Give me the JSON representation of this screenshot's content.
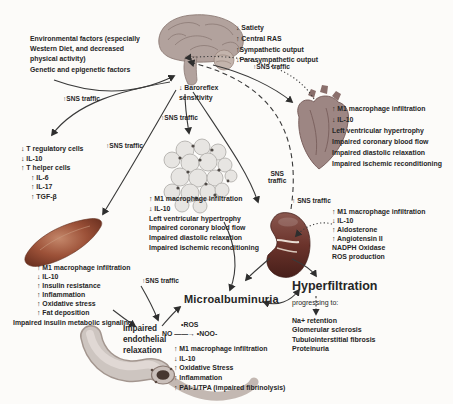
{
  "env_factors": {
    "lines": [
      "Environmental factors (especially",
      "Western Diet, and decreased",
      "physical activity)",
      "Genetic and epigenetic factors"
    ]
  },
  "brain_outputs": {
    "lines": [
      "↓ Satiety",
      "↑ Central RAS",
      "↑Sympathetic output",
      "↓Parasympathetic output"
    ]
  },
  "baroreflex": {
    "lines": [
      "↓ Baroreflex",
      "sensitivity"
    ]
  },
  "sns_labels": {
    "to_tcells": "↑SNS traffic",
    "to_adipose": "↑SNS traffic",
    "to_muscle": "↑SNS traffic",
    "to_heart": "↑SNS traffic",
    "to_kidney": "↑ SNS traffic",
    "to_vessel": "↑SNS traffic",
    "afferent_line1": "SNS",
    "afferent_line2": "traffic"
  },
  "tcell_block": {
    "items": [
      "↓ T regulatory cells",
      "↓ IL-10",
      "↑ T helper cells",
      "↑ IL-6",
      "↑ IL-17",
      "↑ TGF-β"
    ]
  },
  "heart_block": {
    "items": [
      "↑ M1 macrophage infiltration",
      "↓ IL-10",
      "Left ventricular hypertrophy",
      "Impaired coronary blood flow",
      "Impaired diastolic relaxation",
      "Impaired ischemic reconditioning"
    ]
  },
  "center_block": {
    "items": [
      "↑ M1 macrophage infiltration",
      "↓ IL-10",
      "Left ventricular hypertrophy",
      "Impaired coronary blood flow",
      "Impaired diastolic relaxation",
      "Impaired ischemic reconditioning"
    ]
  },
  "kidney_block": {
    "items": [
      "↑ M1 macrophage infiltration",
      "↓ IL-10",
      "↑ Aldosterone",
      "↑ Angiotensin II",
      "NADPH Oxidase",
      "ROS production"
    ]
  },
  "muscle_block": {
    "items": [
      "↑ M1 macrophage infiltration",
      "↓ IL-10",
      "↑ Insulin resistance",
      "↑ Inflammation",
      "↑ Oxidative stress",
      "↑ Fat deposition",
      "Impaired insulin metabolic signaling"
    ]
  },
  "vessel_block": {
    "ros_label": "•ROS",
    "reaction": "NO ——→ •NOO-",
    "items": [
      "↑ M1 macrophage infiltration",
      "↓ IL-10",
      "↑ Oxidative Stress",
      "↑ Inflammation",
      "↑ PAI-1/TPA (impaired fibrinolysis)"
    ]
  },
  "microalbuminuria_label": "Microalbuminuria",
  "hyperfiltration": {
    "title": "Hyperfiltration",
    "subtitle": "progressing to:",
    "items": [
      "Na+ retention",
      "Glomerular sclerosis",
      "Tubulointerstitial fibrosis",
      "Proteinuria"
    ]
  },
  "endothelial": {
    "lines": [
      "Impaired",
      "endothelial",
      "relaxation"
    ]
  },
  "colors": {
    "text": "#262626",
    "arrow": "#333333",
    "muscle": "#9c5138",
    "kidney": "#6b332b",
    "brain": "#b2a29d",
    "heart": "#9d8683",
    "adipose": "#e7e5e2",
    "vessel": "#cdc5c0"
  }
}
